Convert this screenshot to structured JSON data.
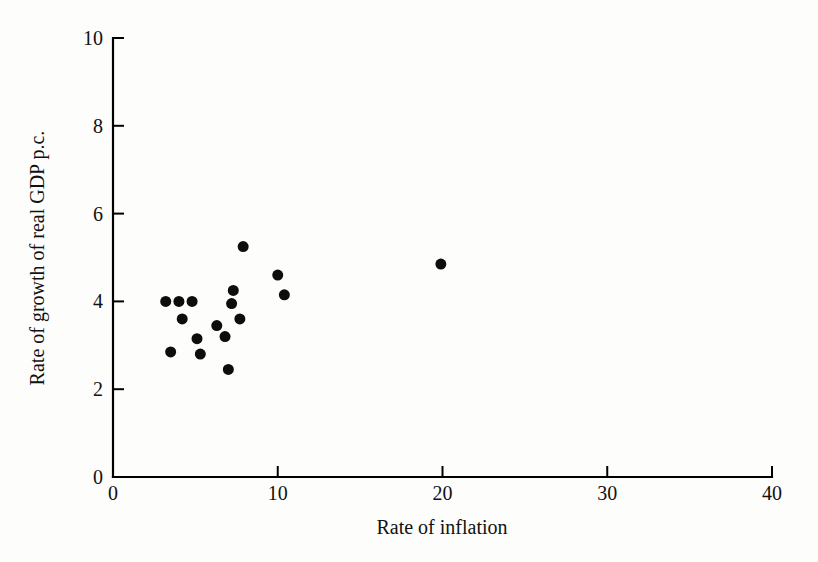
{
  "chart_data": {
    "type": "scatter",
    "title": "",
    "xlabel": "Rate of inflation",
    "ylabel": "Rate of growth of real GDP p.c.",
    "xlim": [
      0,
      40
    ],
    "ylim": [
      0,
      10
    ],
    "xticks": [
      0,
      10,
      20,
      30,
      40
    ],
    "yticks": [
      0,
      2,
      4,
      6,
      8,
      10
    ],
    "xtick_labels": [
      "0",
      "10",
      "20",
      "30",
      "40"
    ],
    "ytick_labels": [
      "0",
      "2",
      "4",
      "6",
      "8",
      "10"
    ],
    "grid": false,
    "legend": "none",
    "marker": {
      "shape": "circle",
      "color": "#0d0d0d",
      "size_px": 11
    },
    "points": [
      {
        "x": 3.2,
        "y": 4.0
      },
      {
        "x": 4.0,
        "y": 4.0
      },
      {
        "x": 4.8,
        "y": 4.0
      },
      {
        "x": 3.5,
        "y": 2.85
      },
      {
        "x": 4.2,
        "y": 3.6
      },
      {
        "x": 5.1,
        "y": 3.15
      },
      {
        "x": 5.3,
        "y": 2.8
      },
      {
        "x": 6.3,
        "y": 3.45
      },
      {
        "x": 6.8,
        "y": 3.2
      },
      {
        "x": 7.0,
        "y": 2.45
      },
      {
        "x": 7.3,
        "y": 4.25
      },
      {
        "x": 7.2,
        "y": 3.95
      },
      {
        "x": 7.9,
        "y": 5.25
      },
      {
        "x": 7.7,
        "y": 3.6
      },
      {
        "x": 10.0,
        "y": 4.6
      },
      {
        "x": 10.4,
        "y": 4.15
      },
      {
        "x": 19.9,
        "y": 4.85
      }
    ]
  },
  "axes": {
    "x_axis_name": "x-axis",
    "y_axis_name": "y-axis"
  }
}
